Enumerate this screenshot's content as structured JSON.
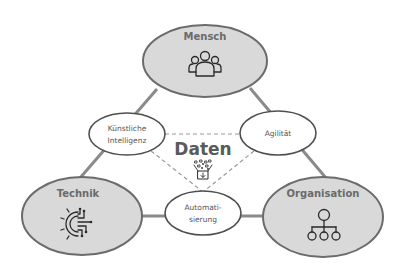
{
  "diagram": {
    "center": {
      "label": "Daten",
      "icon": "data-funnel-icon"
    },
    "pillars": [
      {
        "id": "mensch",
        "label": "Mensch",
        "icon": "people-group-icon"
      },
      {
        "id": "technik",
        "label": "Technik",
        "icon": "gear-circuit-icon"
      },
      {
        "id": "organisation",
        "label": "Organisation",
        "icon": "org-chart-icon"
      }
    ],
    "connectors": [
      {
        "id": "ki",
        "lines": [
          "Künstliche",
          "Intelligenz"
        ],
        "between": [
          "Mensch",
          "Technik"
        ]
      },
      {
        "id": "agilitaet",
        "lines": [
          "Agilität"
        ],
        "between": [
          "Mensch",
          "Organisation"
        ]
      },
      {
        "id": "automatisierung",
        "lines": [
          "Automati-",
          "sierung"
        ],
        "between": [
          "Technik",
          "Organisation"
        ]
      }
    ],
    "colors": {
      "pillar_fill": "#d9d9d9",
      "pillar_stroke": "#6b6b6b",
      "connector_line": "#8a8a8a",
      "dashed_line": "#9a9a9a"
    }
  }
}
